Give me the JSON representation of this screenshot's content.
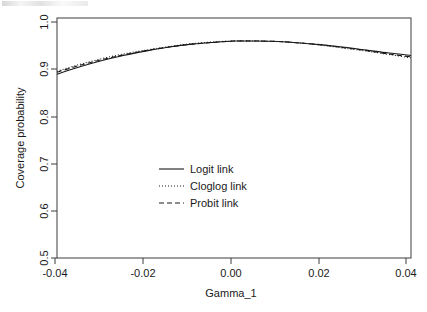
{
  "chart_data": {
    "type": "line",
    "title": "",
    "xlabel": "Gamma_1",
    "ylabel": "Coverage probability",
    "xlim": [
      -0.04,
      0.04
    ],
    "ylim": [
      0.5,
      1.0
    ],
    "xticks": [
      -0.04,
      -0.02,
      0.0,
      0.02,
      0.04
    ],
    "xtick_labels": [
      "-0.04",
      "-0.02",
      "0.00",
      "0.02",
      "0.04"
    ],
    "yticks": [
      0.5,
      0.6,
      0.7,
      0.8,
      0.9,
      1.0
    ],
    "ytick_labels": [
      "0.5",
      "0.6",
      "0.7",
      "0.8",
      "0.9",
      "1.0"
    ],
    "grid": false,
    "legend_position": "center",
    "x": [
      -0.04,
      -0.035,
      -0.03,
      -0.025,
      -0.02,
      -0.015,
      -0.01,
      -0.005,
      0.0,
      0.005,
      0.01,
      0.015,
      0.02,
      0.025,
      0.03,
      0.035,
      0.04
    ],
    "series": [
      {
        "name": "Logit link",
        "style": "solid",
        "color": "#1a1a1a",
        "values": [
          0.883,
          0.898,
          0.911,
          0.922,
          0.931,
          0.939,
          0.945,
          0.949,
          0.952,
          0.952,
          0.951,
          0.948,
          0.944,
          0.939,
          0.933,
          0.927,
          0.922
        ]
      },
      {
        "name": "Cloglog link",
        "style": "dotted",
        "color": "#1a1a1a",
        "values": [
          0.889,
          0.903,
          0.915,
          0.925,
          0.933,
          0.94,
          0.946,
          0.95,
          0.952,
          0.952,
          0.951,
          0.948,
          0.943,
          0.937,
          0.931,
          0.924,
          0.917
        ]
      },
      {
        "name": "Probit link",
        "style": "dashed",
        "color": "#1a1a1a",
        "values": [
          0.887,
          0.901,
          0.913,
          0.923,
          0.932,
          0.939,
          0.945,
          0.949,
          0.952,
          0.952,
          0.951,
          0.948,
          0.944,
          0.938,
          0.932,
          0.925,
          0.919
        ]
      }
    ],
    "legend": [
      {
        "label": "Logit link",
        "style": "solid"
      },
      {
        "label": "Cloglog link",
        "style": "dotted"
      },
      {
        "label": "Probit link",
        "style": "dashed"
      }
    ]
  },
  "axes": {
    "x_title": "Gamma_1",
    "y_title": "Coverage probability",
    "x_tick_labels": [
      "-0.04",
      "-0.02",
      "0.00",
      "0.02",
      "0.04"
    ],
    "y_tick_labels": [
      "0.5",
      "0.6",
      "0.7",
      "0.8",
      "0.9",
      "1.0"
    ]
  },
  "legend": {
    "items": [
      {
        "label": "Logit link"
      },
      {
        "label": "Cloglog link"
      },
      {
        "label": "Probit link"
      }
    ]
  },
  "colors": {
    "line": "#1a1a1a",
    "frame": "#3d3d3d",
    "background": "#ffffff"
  }
}
